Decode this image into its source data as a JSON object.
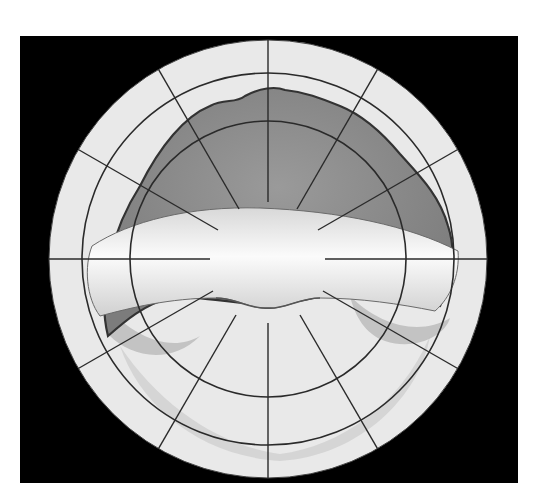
{
  "figure": {
    "type": "retinal drawing chart",
    "colors": {
      "background": "#000000",
      "chart_base": "#e9e9e9",
      "detached_retina": "#8e8e8e",
      "detachment_border": "#3a3a3a",
      "grid_line": "#2a2a2a",
      "fold_highlight": "#f6f6f6",
      "inferior_shadow": "#b8b8b8"
    },
    "grid": {
      "rings": [
        "ora-serrata-outer",
        "ora-serrata",
        "equator"
      ],
      "radial_lines": 12
    }
  }
}
